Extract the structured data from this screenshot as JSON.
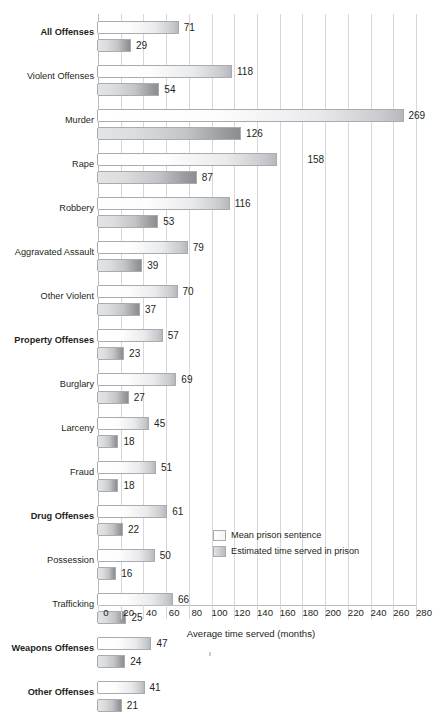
{
  "chart_data": {
    "type": "bar",
    "orientation": "horizontal",
    "title": "",
    "xlabel": "Average time served (months)",
    "ylabel": "",
    "xlim": [
      0,
      280
    ],
    "xticks": [
      0,
      20,
      40,
      60,
      80,
      100,
      120,
      140,
      160,
      180,
      200,
      220,
      240,
      260,
      280
    ],
    "grid": "vertical",
    "legend_position": "inside-bottom-right",
    "categories": [
      "All Offenses",
      "Violent Offenses",
      "Murder",
      "Rape",
      "Robbery",
      "Aggravated Assault",
      "Other Violent",
      "Property Offenses",
      "Burglary",
      "Larceny",
      "Fraud",
      "Drug Offenses",
      "Possession",
      "Trafficking",
      "Weapons Offenses",
      "Other Offenses"
    ],
    "bold_categories": [
      "All Offenses",
      "Property Offenses",
      "Drug Offenses",
      "Weapons Offenses",
      "Other Offenses"
    ],
    "series": [
      {
        "name": "Mean prison sentence",
        "values": [
          71,
          118,
          269,
          158,
          116,
          79,
          70,
          57,
          69,
          45,
          51,
          61,
          50,
          66,
          47,
          41
        ]
      },
      {
        "name": "Estimated time served in prison",
        "values": [
          29,
          54,
          126,
          87,
          53,
          39,
          37,
          23,
          27,
          18,
          18,
          22,
          16,
          25,
          24,
          21
        ]
      }
    ]
  },
  "legend": {
    "items": [
      {
        "label": "Mean prison sentence",
        "swatch": "mean"
      },
      {
        "label": "Estimated time served in prison",
        "swatch": "served"
      }
    ]
  },
  "colors": {
    "gridline": "#d5d7da",
    "axis": "#b9bbbe",
    "bar_border": "#a9abae",
    "text": "#231f20",
    "background": "#ffffff"
  }
}
